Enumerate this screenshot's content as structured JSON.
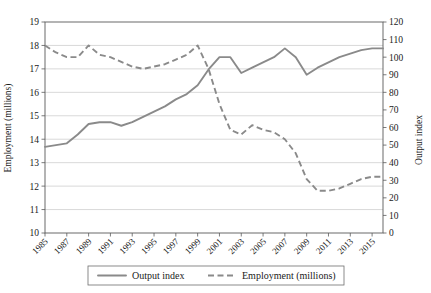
{
  "chart_data": {
    "type": "line",
    "title": "",
    "xlabel": "",
    "ylabel": "Employment (millions)",
    "y2label": "Output index",
    "grid": true,
    "legend_position": "bottom",
    "xlim": [
      1985,
      2016
    ],
    "ylim": [
      10,
      19
    ],
    "y2lim": [
      0,
      120
    ],
    "ytick_labels": [
      "19",
      "18",
      "17",
      "16",
      "15",
      "14",
      "13",
      "12",
      "11",
      "10"
    ],
    "yticks": [
      19,
      18,
      17,
      16,
      15,
      14,
      13,
      12,
      11,
      10
    ],
    "y2tick_labels": [
      "120",
      "110",
      "100",
      "90",
      "80",
      "70",
      "60",
      "50",
      "40",
      "30",
      "20",
      "10",
      "0"
    ],
    "y2ticks": [
      120,
      110,
      100,
      90,
      80,
      70,
      60,
      50,
      40,
      30,
      20,
      10,
      0
    ],
    "xtick_labels": [
      "1985",
      "1987",
      "1989",
      "1991",
      "1993",
      "1995",
      "1997",
      "1999",
      "2001",
      "2003",
      "2005",
      "2007",
      "2009",
      "2011",
      "2013",
      "2015"
    ],
    "xticks": [
      1985,
      1987,
      1989,
      1991,
      1993,
      1995,
      1997,
      1999,
      2001,
      2003,
      2005,
      2007,
      2009,
      2011,
      2013,
      2015
    ],
    "x": [
      1985,
      1986,
      1987,
      1988,
      1989,
      1990,
      1991,
      1992,
      1993,
      1994,
      1995,
      1996,
      1997,
      1998,
      1999,
      2000,
      2001,
      2002,
      2003,
      2004,
      2005,
      2006,
      2007,
      2008,
      2009,
      2010,
      2011,
      2012,
      2013,
      2014,
      2015,
      2016
    ],
    "series": [
      {
        "name": "Output index",
        "axis": "right",
        "style": "solid",
        "color": "#8a8a8a",
        "values": [
          49,
          50,
          51,
          56,
          62,
          63,
          63,
          61,
          63,
          66,
          69,
          72,
          76,
          79,
          84,
          93,
          100,
          100,
          91,
          94,
          97,
          100,
          105,
          100,
          90,
          94,
          97,
          100,
          102,
          104,
          105,
          105
        ]
      },
      {
        "name": "Employment (millions)",
        "axis": "left",
        "style": "dashed",
        "color": "#8a8a8a",
        "values": [
          18.0,
          17.7,
          17.5,
          17.5,
          18.0,
          17.6,
          17.5,
          17.3,
          17.1,
          17.0,
          17.1,
          17.2,
          17.4,
          17.6,
          18.0,
          17.0,
          15.5,
          14.4,
          14.2,
          14.6,
          14.4,
          14.3,
          14.0,
          13.4,
          12.3,
          11.8,
          11.8,
          11.9,
          12.1,
          12.3,
          12.4,
          12.4
        ]
      }
    ]
  },
  "legend": {
    "items": [
      {
        "label": "Output index",
        "style": "solid"
      },
      {
        "label": "Employment (millions)",
        "style": "dashed"
      }
    ]
  }
}
